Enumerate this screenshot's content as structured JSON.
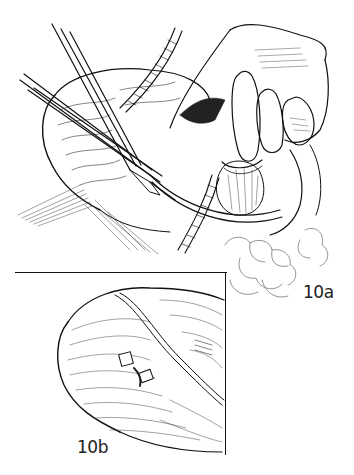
{
  "figure": {
    "type": "surgical line illustration",
    "colors": {
      "ink": "#111111",
      "paper": "#ffffff"
    },
    "panels": [
      {
        "label": "10a",
        "description": "Operative view: forceps/clamps and ribbed tubing inserted at the field, a hand retracting tissue at top right, lobulated omentum/fat at lower right"
      },
      {
        "label": "10b",
        "description": "Inset detail: rounded organ with clip marks and a curved vessel crossing the surface"
      }
    ]
  }
}
